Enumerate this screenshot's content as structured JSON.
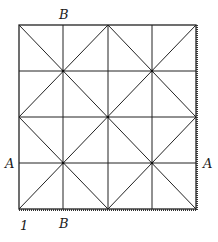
{
  "figure": {
    "type": "square grid fold diagram",
    "grid_divisions": 4,
    "labels": {
      "top_b": "B",
      "bottom_b": "B",
      "left_a": "A",
      "right_a": "A",
      "corner": "1"
    },
    "colors": {
      "line": "#222222",
      "background": "#ffffff"
    }
  }
}
